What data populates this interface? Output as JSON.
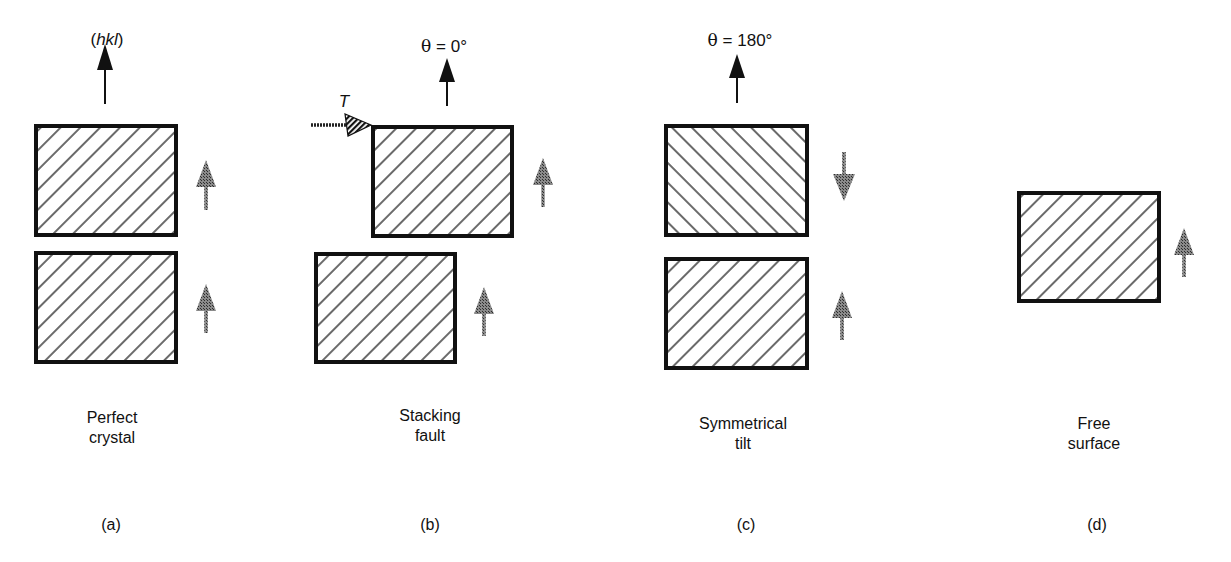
{
  "panels": [
    {
      "id": "a",
      "letter": "(a)",
      "caption_lines": [
        "Perfect",
        "crystal"
      ],
      "top_label": {
        "prefix": "(",
        "italic": "hkl",
        "suffix": ")"
      },
      "lower_grain_arrow": "up",
      "upper_grain_arrow": "up",
      "upper_hatch": "backslash",
      "lower_hatch": "backslash"
    },
    {
      "id": "b",
      "letter": "(b)",
      "caption_lines": [
        "Stacking",
        "fault"
      ],
      "top_label": {
        "theta": "θ",
        "text": " = 0°"
      },
      "translation_label": "T",
      "lower_grain_arrow": "up",
      "upper_grain_arrow": "up",
      "upper_hatch": "backslash",
      "lower_hatch": "backslash"
    },
    {
      "id": "c",
      "letter": "(c)",
      "caption_lines": [
        "Symmetrical",
        "tilt"
      ],
      "top_label": {
        "theta": "θ",
        "text": " = 180°"
      },
      "lower_grain_arrow": "up",
      "upper_grain_arrow": "down",
      "upper_hatch": "slash",
      "lower_hatch": "backslash"
    },
    {
      "id": "d",
      "letter": "(d)",
      "caption_lines": [
        "Free",
        "surface"
      ],
      "grain_arrow": "up",
      "hatch": "backslash"
    }
  ],
  "colors": {
    "outline": "#111111",
    "hatch": "#1a1a1a",
    "grain_arrow": "#6e6e6e",
    "normal_arrow": "#111111",
    "background": "#ffffff"
  }
}
